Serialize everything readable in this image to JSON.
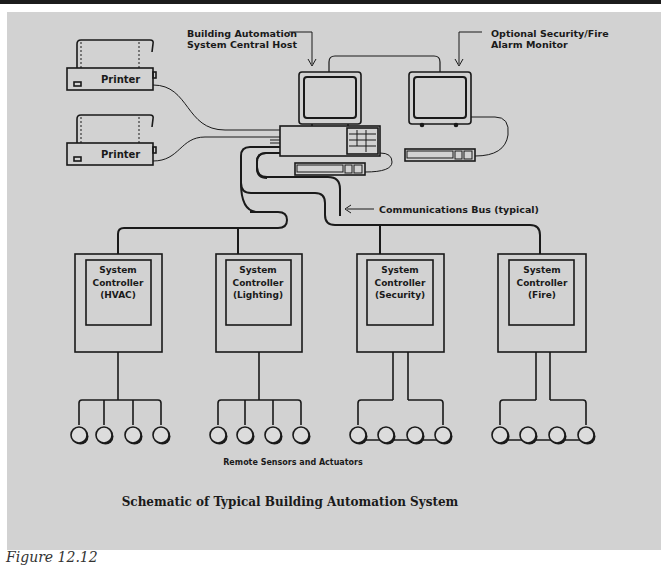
{
  "diagram": {
    "title": "Schematic of Typical Building Automation System",
    "caption": "Figure 12.12",
    "labels": {
      "central_host": [
        "Building Automation",
        "System Central Host"
      ],
      "security_monitor": [
        "Optional Security/Fire",
        "Alarm Monitor"
      ],
      "comm_bus": "Communications Bus (typical)",
      "sensors": "Remote Sensors and Actuators"
    },
    "printers": [
      {
        "label": "Printer"
      },
      {
        "label": "Printer"
      }
    ],
    "controllers": [
      {
        "line1": "System",
        "line2": "Controller",
        "line3": "(HVAC)",
        "topology": "star",
        "sensor_count": 4
      },
      {
        "line1": "System",
        "line2": "Controller",
        "line3": "(Lighting)",
        "topology": "star",
        "sensor_count": 4
      },
      {
        "line1": "System",
        "line2": "Controller",
        "line3": "(Security)",
        "topology": "loop",
        "sensor_count": 4
      },
      {
        "line1": "System",
        "line2": "Controller",
        "line3": "(Fire)",
        "topology": "loop",
        "sensor_count": 4
      }
    ],
    "colors": {
      "background": "#d2d2d2",
      "line": "#1a1a1a",
      "top_rule": "#1c1c1c"
    }
  }
}
